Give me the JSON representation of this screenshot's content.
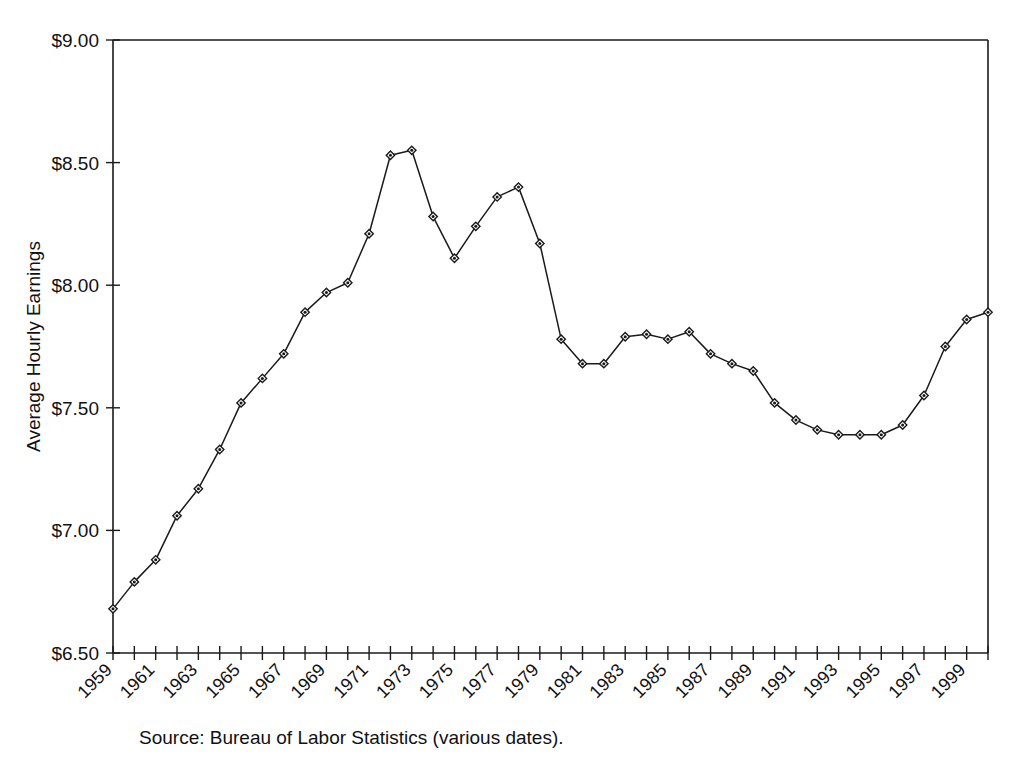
{
  "figure": {
    "source_note": "Source: Bureau of Labor Statistics (various dates).",
    "top_bleed_text": ""
  },
  "chart_data": {
    "type": "line",
    "title": "",
    "xlabel": "",
    "ylabel": "Average Hourly Earnings",
    "ylim": [
      6.5,
      9.0
    ],
    "xlim": [
      1959,
      2000
    ],
    "ytick_labels": [
      "$9.00",
      "$8.50",
      "$8.00",
      "$7.50",
      "$7.00",
      "$6.50"
    ],
    "ytick_values": [
      9.0,
      8.5,
      8.0,
      7.5,
      7.0,
      6.5
    ],
    "xtick_labels": [
      "1959",
      "1961",
      "1963",
      "1965",
      "1967",
      "1969",
      "1971",
      "1973",
      "1975",
      "1977",
      "1979",
      "1981",
      "1983",
      "1985",
      "1987",
      "1989",
      "1991",
      "1993",
      "1995",
      "1997",
      "1999"
    ],
    "xtick_label_rotation_deg": 45,
    "minor_xticks_every_year": true,
    "grid": false,
    "legend": "none",
    "marker": "diamond",
    "line_color": "#1a1a1a",
    "x": [
      1959,
      1960,
      1961,
      1962,
      1963,
      1964,
      1965,
      1966,
      1967,
      1968,
      1969,
      1970,
      1971,
      1972,
      1973,
      1974,
      1975,
      1976,
      1977,
      1978,
      1979,
      1980,
      1981,
      1982,
      1983,
      1984,
      1985,
      1986,
      1987,
      1988,
      1989,
      1990,
      1991,
      1992,
      1993,
      1994,
      1995,
      1996,
      1997,
      1998,
      1999,
      2000
    ],
    "values": [
      6.68,
      6.79,
      6.88,
      7.06,
      7.17,
      7.33,
      7.52,
      7.62,
      7.72,
      7.89,
      7.97,
      8.01,
      8.21,
      8.53,
      8.55,
      8.28,
      8.11,
      8.24,
      8.36,
      8.4,
      8.17,
      7.78,
      7.68,
      7.68,
      7.79,
      7.8,
      7.78,
      7.81,
      7.72,
      7.68,
      7.65,
      7.52,
      7.45,
      7.41,
      7.39,
      7.39,
      7.39,
      7.43,
      7.55,
      7.75,
      7.86,
      7.89
    ],
    "series_name": "Average Hourly Earnings"
  }
}
